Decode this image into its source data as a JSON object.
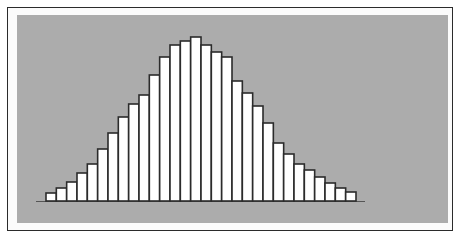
{
  "chart_data": {
    "type": "bar",
    "title": "",
    "xlabel": "",
    "ylabel": "",
    "categories": [
      "1",
      "2",
      "3",
      "4",
      "5",
      "6",
      "7",
      "8",
      "9",
      "10",
      "11",
      "12",
      "13",
      "14",
      "15",
      "16",
      "17",
      "18",
      "19",
      "20",
      "21",
      "22",
      "23",
      "24",
      "25",
      "26",
      "27",
      "28",
      "29",
      "30"
    ],
    "values": [
      8,
      13,
      19,
      28,
      37,
      52,
      68,
      84,
      97,
      106,
      126,
      144,
      156,
      160,
      164,
      156,
      149,
      144,
      120,
      108,
      95,
      78,
      58,
      47,
      37,
      31,
      24,
      18,
      13,
      9
    ],
    "ylim": [
      0,
      170
    ],
    "grid": false,
    "legend": null,
    "colors": {
      "background_panel": "#acacac",
      "bar_fill": "#ffffff",
      "bar_stroke": "#2b2b2b",
      "frame": "#2b2b2b"
    }
  }
}
